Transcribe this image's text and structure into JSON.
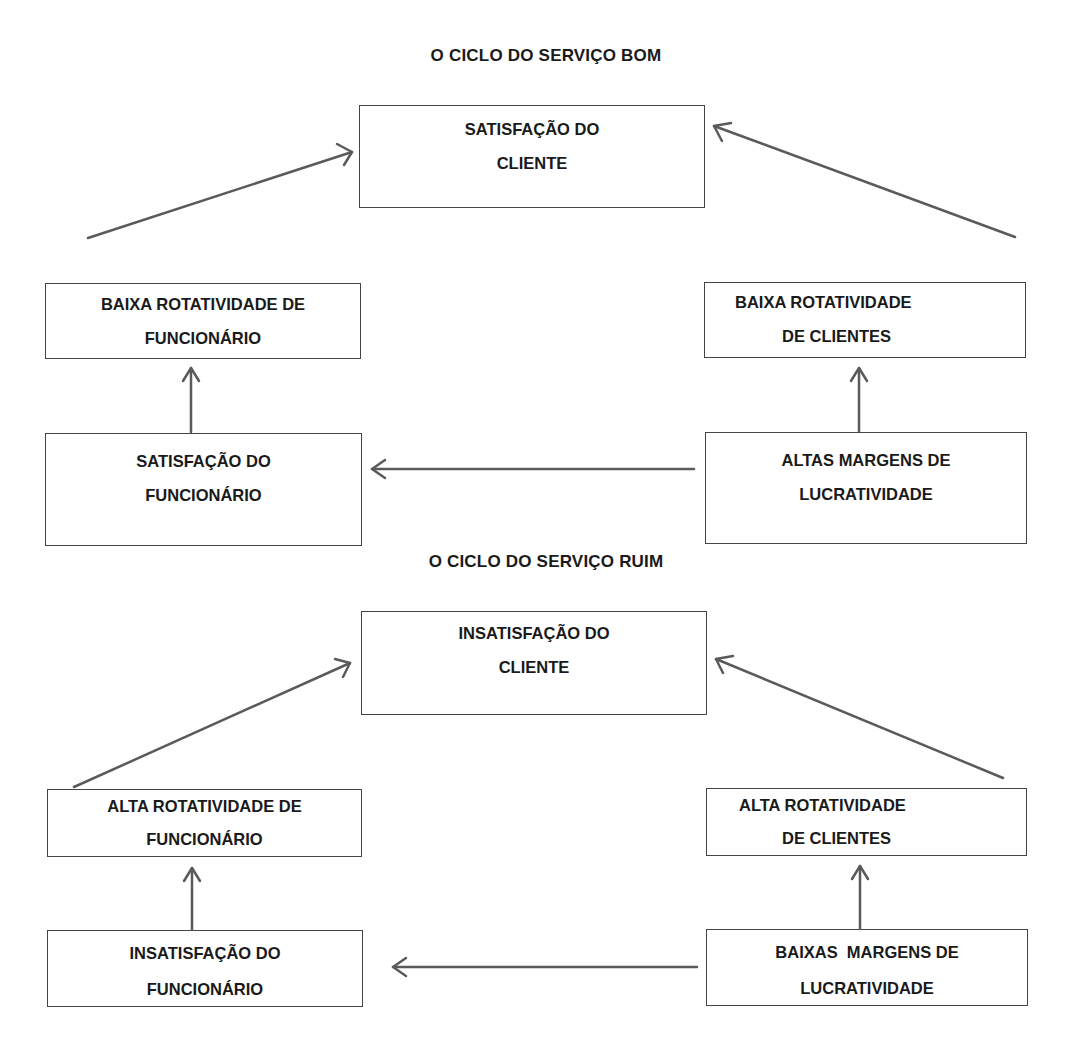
{
  "diagrams": [
    {
      "id": "good",
      "title": "O CICLO DO SERVIÇO BOM",
      "nodes": {
        "customer": {
          "line1": "SATISFAÇÃO DO",
          "line2": "CLIENTE"
        },
        "employee_turnover": {
          "line1": "BAIXA ROTATIVIDADE DE",
          "line2": "FUNCIONÁRIO"
        },
        "customer_turnover": {
          "line1": "BAIXA ROTATIVIDADE",
          "line2": "DE CLIENTES"
        },
        "employee_satisfaction": {
          "line1": "SATISFAÇÃO DO",
          "line2": "FUNCIONÁRIO"
        },
        "profit_margins": {
          "line1": "ALTAS MARGENS DE",
          "line2": "LUCRATIVIDADE"
        }
      },
      "edges": [
        {
          "from": "profit_margins",
          "to": "employee_satisfaction"
        },
        {
          "from": "employee_satisfaction",
          "to": "employee_turnover"
        },
        {
          "from": "employee_turnover",
          "to": "customer"
        },
        {
          "from": "customer_turnover",
          "to": "customer"
        },
        {
          "from": "profit_margins",
          "to": "customer_turnover"
        }
      ]
    },
    {
      "id": "bad",
      "title": "O CICLO DO SERVIÇO RUIM",
      "nodes": {
        "customer": {
          "line1": "INSATISFAÇÃO DO",
          "line2": "CLIENTE"
        },
        "employee_turnover": {
          "line1": "ALTA ROTATIVIDADE DE",
          "line2": "FUNCIONÁRIO"
        },
        "customer_turnover": {
          "line1": "ALTA ROTATIVIDADE",
          "line2": "DE CLIENTES"
        },
        "employee_satisfaction": {
          "line1": "INSATISFAÇÃO DO",
          "line2": "FUNCIONÁRIO"
        },
        "profit_margins": {
          "line1": "BAIXAS  MARGENS DE",
          "line2": "LUCRATIVIDADE"
        }
      },
      "edges": [
        {
          "from": "profit_margins",
          "to": "employee_satisfaction"
        },
        {
          "from": "employee_satisfaction",
          "to": "employee_turnover"
        },
        {
          "from": "employee_turnover",
          "to": "customer"
        },
        {
          "from": "customer_turnover",
          "to": "customer"
        },
        {
          "from": "profit_margins",
          "to": "customer_turnover"
        }
      ]
    }
  ],
  "colors": {
    "text": "#1a1a1a",
    "border": "#444444",
    "arrow": "#5a5a5a",
    "background": "#ffffff"
  }
}
